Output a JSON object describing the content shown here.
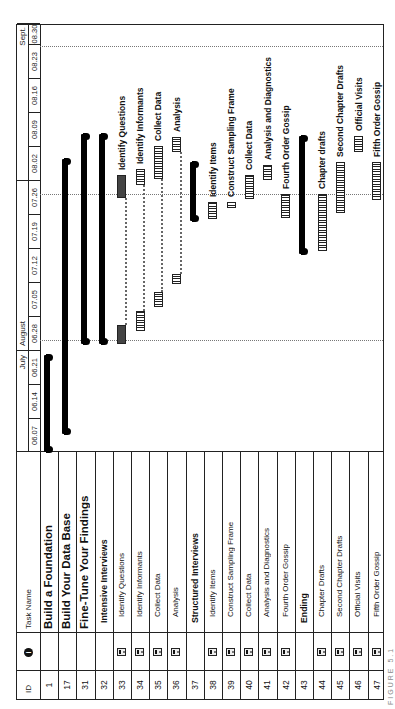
{
  "table": {
    "headers": {
      "id": "ID",
      "indicators": "i",
      "task_name": "Task Name"
    },
    "rows": [
      {
        "id": "1",
        "name": "Build a Foundation",
        "level": 1,
        "note": false
      },
      {
        "id": "17",
        "name": "Build Your Data Base",
        "level": 1,
        "note": false
      },
      {
        "id": "31",
        "name": "Fine-Tune Your Findings",
        "level": 1,
        "note": false
      },
      {
        "id": "32",
        "name": "Intensive Interviews",
        "level": 2,
        "note": false
      },
      {
        "id": "33",
        "name": "Identify Questions",
        "level": 3,
        "note": true
      },
      {
        "id": "34",
        "name": "Identify Informants",
        "level": 3,
        "note": true
      },
      {
        "id": "35",
        "name": "Collect Data",
        "level": 3,
        "note": true
      },
      {
        "id": "36",
        "name": "Analysis",
        "level": 3,
        "note": true
      },
      {
        "id": "37",
        "name": "Structured Interviews",
        "level": 2,
        "note": false
      },
      {
        "id": "38",
        "name": "Identify Items",
        "level": 3,
        "note": true
      },
      {
        "id": "39",
        "name": "Construct Sampling Frame",
        "level": 3,
        "note": true
      },
      {
        "id": "40",
        "name": "Collect Data",
        "level": 3,
        "note": true
      },
      {
        "id": "41",
        "name": "Analysis and Diagnostics",
        "level": 3,
        "note": true
      },
      {
        "id": "42",
        "name": "Fourth Order Gossip",
        "level": 3,
        "note": true
      },
      {
        "id": "43",
        "name": "Ending",
        "level": 2,
        "note": false
      },
      {
        "id": "44",
        "name": "Chapter Drafts",
        "level": 3,
        "note": true
      },
      {
        "id": "45",
        "name": "Second Chapter Drafts",
        "level": 3,
        "note": true
      },
      {
        "id": "46",
        "name": "Official Visits",
        "level": 3,
        "note": true
      },
      {
        "id": "47",
        "name": "Fifth Order Gossip",
        "level": 3,
        "note": true
      }
    ]
  },
  "timeline": {
    "months": [
      {
        "label": "July",
        "end_u": 349
      },
      {
        "label": "August",
        "start_u": 349,
        "end_u": 519
      },
      {
        "label": "Sept.",
        "start_u": 655,
        "end_u": 676
      }
    ],
    "weeks": [
      "06.07",
      "06.14",
      "06.21",
      "06.28",
      "07.05",
      "07.12",
      "07.19",
      "07.26",
      "08.02",
      "08.09",
      "08.16",
      "08.23",
      "08.30"
    ],
    "week_px": 34,
    "start_u": 247,
    "dashed_lines_u": [
      358,
      504,
      652
    ]
  },
  "chart_data": {
    "type": "gantt",
    "title": "",
    "xlabel": "Week starting (June–August)",
    "orientation": "rotated -90deg (text reads bottom-to-top)",
    "x_ticks": [
      "06.07",
      "06.14",
      "06.21",
      "06.28",
      "07.05",
      "07.12",
      "07.19",
      "07.26",
      "08.02",
      "08.09",
      "08.16",
      "08.23",
      "08.30"
    ],
    "month_labels": [
      "July",
      "August",
      "Sept."
    ],
    "rows": [
      {
        "id": "1",
        "task": "Build a Foundation",
        "kind": "summary",
        "segments": [
          [
            247,
            344
          ]
        ],
        "approx_dates": [
          "06.07",
          "06.25"
        ]
      },
      {
        "id": "17",
        "task": "Build Your Data Base",
        "kind": "summary",
        "segments": [
          [
            265,
            540
          ]
        ],
        "approx_dates": [
          "06.10",
          "08.02"
        ]
      },
      {
        "id": "31",
        "task": "Fine-Tune Your Findings",
        "kind": "summary",
        "segments": [
          [
            355,
            565
          ]
        ],
        "approx_dates": [
          "06.28",
          "08.08"
        ]
      },
      {
        "id": "32",
        "task": "Intensive Interviews",
        "kind": "summary",
        "segments": [
          [
            355,
            565
          ]
        ],
        "approx_dates": [
          "06.28",
          "08.08"
        ]
      },
      {
        "id": "33",
        "task": "Identify Questions",
        "kind": "task-dark",
        "segments": [
          [
            355,
            374
          ],
          [
            501,
            524
          ]
        ],
        "label": "Identify Questions"
      },
      {
        "id": "34",
        "task": "Identify Informants",
        "kind": "task",
        "segments": [
          [
            368,
            388
          ],
          [
            514,
            530
          ]
        ],
        "label": "Identify Informants"
      },
      {
        "id": "35",
        "task": "Collect Data",
        "kind": "task",
        "segments": [
          [
            392,
            407
          ],
          [
            520,
            553
          ]
        ],
        "label": "Collect Data"
      },
      {
        "id": "36",
        "task": "Analysis",
        "kind": "task",
        "segments": [
          [
            415,
            425
          ],
          [
            547,
            562
          ]
        ],
        "label": "Analysis"
      },
      {
        "id": "37",
        "task": "Structured Interviews",
        "kind": "summary",
        "segments": [
          [
            478,
            537
          ]
        ]
      },
      {
        "id": "38",
        "task": "Identify Items",
        "kind": "task",
        "segments": [
          [
            480,
            497
          ]
        ],
        "label": "Identify Items"
      },
      {
        "id": "39",
        "task": "Construct Sampling Frame",
        "kind": "task",
        "segments": [
          [
            491,
            497
          ]
        ],
        "label": "Construct Sampling Frame"
      },
      {
        "id": "40",
        "task": "Collect Data",
        "kind": "task",
        "segments": [
          [
            500,
            524
          ]
        ],
        "label": "Collect Data"
      },
      {
        "id": "41",
        "task": "Analysis and Diagnostics",
        "kind": "task",
        "segments": [
          [
            519,
            534
          ]
        ],
        "label": "Analysis and Diagnostics"
      },
      {
        "id": "42",
        "task": "Fourth Order Gossip",
        "kind": "task",
        "segments": [
          [
            481,
            505
          ]
        ],
        "label": "Fourth Order Gossip"
      },
      {
        "id": "43",
        "task": "Ending",
        "kind": "summary",
        "segments": [
          [
            445,
            563
          ]
        ]
      },
      {
        "id": "44",
        "task": "Chapter Drafts",
        "kind": "task",
        "segments": [
          [
            448,
            505
          ]
        ],
        "label": "Chapter drafts"
      },
      {
        "id": "45",
        "task": "Second Chapter Drafts",
        "kind": "task",
        "segments": [
          [
            486,
            537
          ]
        ],
        "label": "Second Chapter Drafts"
      },
      {
        "id": "46",
        "task": "Official Visits",
        "kind": "task",
        "segments": [
          [
            547,
            563
          ]
        ],
        "label": "Official Visits"
      },
      {
        "id": "47",
        "task": "Fifth Order Gossip",
        "kind": "task",
        "segments": [
          [
            499,
            537
          ]
        ],
        "label": "Fifth Order Gossip"
      }
    ],
    "grid": false,
    "legend": null
  },
  "caption": "FIGURE 5.1",
  "colors": {
    "summary": "#000000",
    "task_dark": "#444444",
    "border": "#222222",
    "dashed": "#777777"
  }
}
